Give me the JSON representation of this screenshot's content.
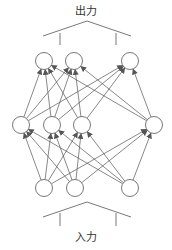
{
  "labels": {
    "output": "出力",
    "input": "入力"
  },
  "colors": {
    "stroke": "#555555",
    "node_fill": "#ffffff"
  },
  "network": {
    "node_radius": 8.5,
    "layers": [
      {
        "name": "input",
        "y": 188,
        "nodes": [
          44,
          75,
          130
        ]
      },
      {
        "name": "hidden",
        "y": 125,
        "nodes": [
          21,
          52,
          82,
          154
        ]
      },
      {
        "name": "output",
        "y": 61,
        "nodes": [
          44,
          74,
          130
        ]
      }
    ],
    "connections": "fully-connected upward with arrowheads"
  },
  "brackets": {
    "top": {
      "peak": [
        87,
        21
      ],
      "left": [
        43,
        36
      ],
      "right": [
        131,
        36
      ],
      "ticks": [
        [
          60,
          33,
          45
        ],
        [
          116,
          33,
          45
        ]
      ]
    },
    "bottom": {
      "peak": [
        87,
        202
      ],
      "left": [
        43,
        217
      ],
      "right": [
        131,
        217
      ],
      "ticks": [
        [
          60,
          213,
          226
        ],
        [
          116,
          213,
          226
        ]
      ]
    }
  }
}
